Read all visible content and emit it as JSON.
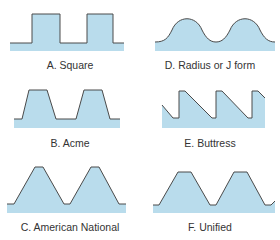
{
  "colors": {
    "fill": "#b9dcec",
    "stroke": "#4a4a4a",
    "text": "#333333"
  },
  "panels": [
    {
      "id": "A",
      "label": "A. Square"
    },
    {
      "id": "B",
      "label": "B. Acme"
    },
    {
      "id": "C",
      "label": "C. American National"
    },
    {
      "id": "D",
      "label": "D. Radius or J form"
    },
    {
      "id": "E",
      "label": "E. Buttress"
    },
    {
      "id": "F",
      "label": "F. Unified"
    }
  ]
}
